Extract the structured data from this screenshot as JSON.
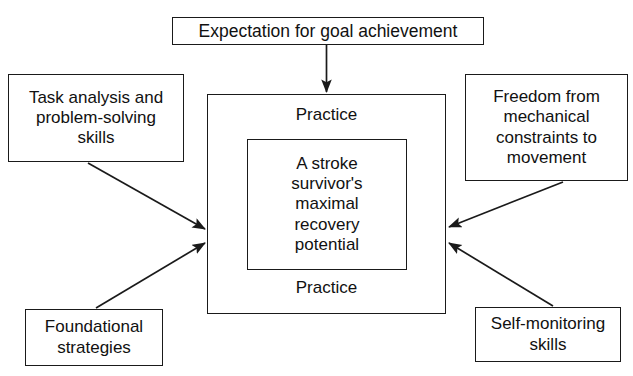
{
  "diagram": {
    "background_color": "#ffffff",
    "line_color": "#1a1a1a",
    "text_color": "#111111",
    "boxes": {
      "expectation": {
        "label": "Expectation for goal achievement",
        "position": "top-center"
      },
      "task_analysis": {
        "label": "Task analysis and\nproblem-solving\nskills",
        "position": "left-upper"
      },
      "foundational": {
        "label": "Foundational\nstrategies",
        "position": "left-lower"
      },
      "freedom": {
        "label": "Freedom from\nmechanical\nconstraints to\nmovement",
        "position": "right-upper"
      },
      "self_monitoring": {
        "label": "Self-monitoring\nskills",
        "position": "right-lower"
      },
      "core": {
        "label": "A stroke\nsurvivor's\nmaximal\nrecovery\npotential",
        "position": "center"
      }
    },
    "practice": {
      "top_label": "Practice",
      "bottom_label": "Practice"
    },
    "arrows": [
      {
        "name": "expectation-to-center",
        "from": "expectation",
        "to": "central-outer",
        "direction": "down"
      },
      {
        "name": "task-analysis-to-center",
        "from": "task_analysis",
        "to": "central-outer",
        "direction": "down-right"
      },
      {
        "name": "foundational-to-center",
        "from": "foundational",
        "to": "central-outer",
        "direction": "up-right"
      },
      {
        "name": "freedom-to-center",
        "from": "freedom",
        "to": "central-outer",
        "direction": "down-left"
      },
      {
        "name": "self-monitoring-to-center",
        "from": "self_monitoring",
        "to": "central-outer",
        "direction": "up-left"
      }
    ]
  }
}
